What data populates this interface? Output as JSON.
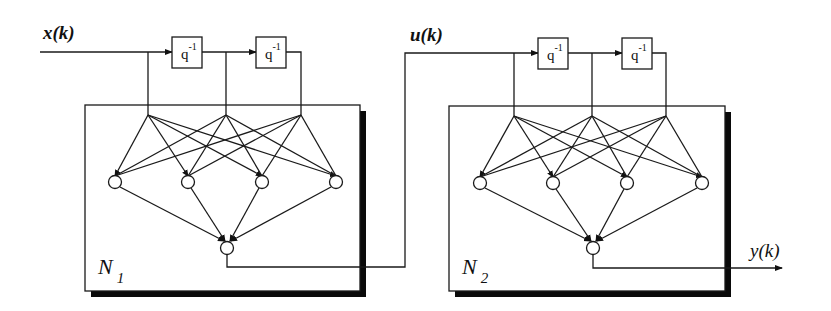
{
  "labels": {
    "input": "x(k)",
    "intermediate": "u(k)",
    "output": "y(k)"
  },
  "networks": [
    {
      "name_base": "N",
      "name_sub": "1",
      "delay_blocks": [
        {
          "base": "q",
          "exp": "-1"
        },
        {
          "base": "q",
          "exp": "-1"
        }
      ],
      "input_taps": 3,
      "hidden_nodes": 4,
      "output_nodes": 1
    },
    {
      "name_base": "N",
      "name_sub": "2",
      "delay_blocks": [
        {
          "base": "q",
          "exp": "-1"
        },
        {
          "base": "q",
          "exp": "-1"
        }
      ],
      "input_taps": 3,
      "hidden_nodes": 4,
      "output_nodes": 1
    }
  ],
  "colors": {
    "line": "#1a1a1a",
    "shadow": "#0a0a0a",
    "background": "#ffffff"
  }
}
